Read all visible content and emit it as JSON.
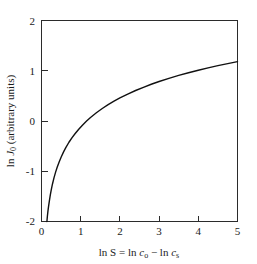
{
  "chart_data": {
    "type": "line",
    "title": "",
    "subtitle": "",
    "xlabel": "ln S = ln c_o − ln c_s",
    "ylabel": "ln J_0 (arbitrary units)",
    "xlabel_parts": {
      "prefix": "ln S = ln ",
      "sym1": "c",
      "sub1": "o",
      "minus": " − ln ",
      "sym2": "c",
      "sub2": "s"
    },
    "ylabel_parts": {
      "prefix": "ln ",
      "sym": "J",
      "sub": "0",
      "suffix": " (arbitrary units)"
    },
    "xlim": [
      0,
      5
    ],
    "ylim": [
      -2,
      2
    ],
    "xticks": [
      0,
      1,
      2,
      3,
      4,
      5
    ],
    "xtick_labels": [
      "0",
      "1",
      "2",
      "3",
      "4",
      "5"
    ],
    "yticks": [
      -2,
      -1,
      0,
      1,
      2
    ],
    "ytick_labels": [
      "-2",
      "-1",
      "0",
      "1",
      "2"
    ],
    "grid": false,
    "legend": "none",
    "tick_direction": "in",
    "frame": "box",
    "line_color": "#111111",
    "series": [
      {
        "name": "nucleation-rate-curve",
        "x": [
          0.138,
          0.15,
          0.165,
          0.18,
          0.2,
          0.225,
          0.25,
          0.28,
          0.32,
          0.36,
          0.4,
          0.45,
          0.5,
          0.56,
          0.62,
          0.7,
          0.78,
          0.86,
          0.95,
          1.05,
          1.15,
          1.25,
          1.4,
          1.55,
          1.7,
          1.85,
          2.0,
          2.2,
          2.4,
          2.6,
          2.8,
          3.0,
          3.25,
          3.5,
          3.75,
          4.0,
          4.25,
          4.5,
          4.75,
          5.0
        ],
        "y": [
          -2.0,
          -1.895,
          -1.79,
          -1.7,
          -1.595,
          -1.47,
          -1.365,
          -1.253,
          -1.126,
          -1.017,
          -0.922,
          -0.816,
          -0.722,
          -0.62,
          -0.53,
          -0.423,
          -0.33,
          -0.248,
          -0.163,
          -0.078,
          -0.001,
          0.07,
          0.164,
          0.249,
          0.326,
          0.396,
          0.46,
          0.537,
          0.607,
          0.671,
          0.731,
          0.786,
          0.849,
          0.907,
          0.96,
          1.01,
          1.057,
          1.101,
          1.142,
          1.181
        ]
      }
    ],
    "annotations": [],
    "notes": {
      "curve_crosses_zero_at_x": 1.05,
      "curve_value_at_x5": 1.62,
      "curve_start_x_at_ymin": 0.14
    }
  }
}
